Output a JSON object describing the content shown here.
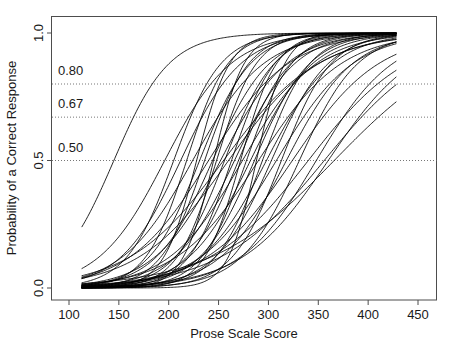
{
  "chart_data": {
    "type": "line",
    "title": "",
    "xlabel": "Prose Scale Score",
    "ylabel": "Probability of a Correct Response",
    "xlim": [
      113,
      428
    ],
    "ylim": [
      0,
      1
    ],
    "xticks": [
      100,
      150,
      200,
      250,
      300,
      350,
      400,
      450
    ],
    "xticklabels": [
      "100",
      "150",
      "200",
      "250",
      "300",
      "350",
      "400",
      "450"
    ],
    "yticks": [
      0.0,
      0.5,
      1.0
    ],
    "yticklabels": [
      "0.0",
      "0.5",
      "1.0"
    ],
    "grid": false,
    "legend": null,
    "reference_lines": [
      {
        "label": "0.80",
        "value": 0.8
      },
      {
        "label": "0.67",
        "value": 0.67
      },
      {
        "label": "0.50",
        "value": 0.5
      }
    ],
    "model": "2PL logistic: P(x) = 1 / (1 + exp(-a*(x-b)))",
    "series": [
      {
        "name": "item-01",
        "b": 145,
        "a": 0.036
      },
      {
        "name": "item-02",
        "b": 196,
        "a": 0.03
      },
      {
        "name": "item-03",
        "b": 205,
        "a": 0.042
      },
      {
        "name": "item-04",
        "b": 212,
        "a": 0.033
      },
      {
        "name": "item-05",
        "b": 218,
        "a": 0.048
      },
      {
        "name": "item-06",
        "b": 224,
        "a": 0.028
      },
      {
        "name": "item-07",
        "b": 231,
        "a": 0.039
      },
      {
        "name": "item-08",
        "b": 236,
        "a": 0.045
      },
      {
        "name": "item-09",
        "b": 240,
        "a": 0.025
      },
      {
        "name": "item-10",
        "b": 244,
        "a": 0.035
      },
      {
        "name": "item-11",
        "b": 248,
        "a": 0.05
      },
      {
        "name": "item-12",
        "b": 252,
        "a": 0.03
      },
      {
        "name": "item-13",
        "b": 256,
        "a": 0.04
      },
      {
        "name": "item-14",
        "b": 260,
        "a": 0.022
      },
      {
        "name": "item-15",
        "b": 263,
        "a": 0.046
      },
      {
        "name": "item-16",
        "b": 266,
        "a": 0.033
      },
      {
        "name": "item-17",
        "b": 270,
        "a": 0.038
      },
      {
        "name": "item-18",
        "b": 274,
        "a": 0.027
      },
      {
        "name": "item-19",
        "b": 278,
        "a": 0.044
      },
      {
        "name": "item-20",
        "b": 282,
        "a": 0.032
      },
      {
        "name": "item-21",
        "b": 286,
        "a": 0.036
      },
      {
        "name": "item-22",
        "b": 290,
        "a": 0.024
      },
      {
        "name": "item-23",
        "b": 294,
        "a": 0.042
      },
      {
        "name": "item-24",
        "b": 298,
        "a": 0.03
      },
      {
        "name": "item-25",
        "b": 303,
        "a": 0.035
      },
      {
        "name": "item-26",
        "b": 308,
        "a": 0.026
      },
      {
        "name": "item-27",
        "b": 313,
        "a": 0.04
      },
      {
        "name": "item-28",
        "b": 318,
        "a": 0.03
      },
      {
        "name": "item-29",
        "b": 324,
        "a": 0.023
      },
      {
        "name": "item-30",
        "b": 331,
        "a": 0.034
      },
      {
        "name": "item-31",
        "b": 340,
        "a": 0.02
      },
      {
        "name": "item-32",
        "b": 348,
        "a": 0.026
      },
      {
        "name": "item-33",
        "b": 356,
        "a": 0.019
      },
      {
        "name": "item-34",
        "b": 360,
        "a": 0.023
      },
      {
        "name": "item-35",
        "b": 366,
        "a": 0.016
      },
      {
        "name": "item-36",
        "b": 228,
        "a": 0.06
      },
      {
        "name": "item-37",
        "b": 245,
        "a": 0.065
      },
      {
        "name": "item-38",
        "b": 272,
        "a": 0.055
      },
      {
        "name": "item-39",
        "b": 288,
        "a": 0.07
      },
      {
        "name": "item-40",
        "b": 255,
        "a": 0.021
      }
    ]
  },
  "axes": {
    "y_axis_title": "Probability of a Correct Response",
    "x_axis_title": "Prose Scale Score"
  }
}
